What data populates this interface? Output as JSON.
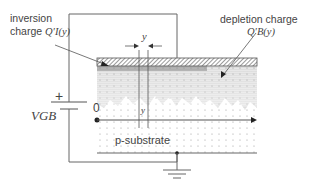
{
  "labels": {
    "inversion_line1": "inversion",
    "inversion_line2": "charge",
    "inversion_symbol": "Q′I(y)",
    "depletion_line1": "depletion charge",
    "depletion_symbol": "Q′B(y)",
    "dy_label": "y",
    "y_label": "y",
    "plus": "+",
    "vgb": "VGB",
    "origin": "0",
    "substrate": "p-substrate"
  },
  "colors": {
    "line": "#555555",
    "text": "#444444",
    "hatch": "#666666",
    "dots": "#888888"
  }
}
